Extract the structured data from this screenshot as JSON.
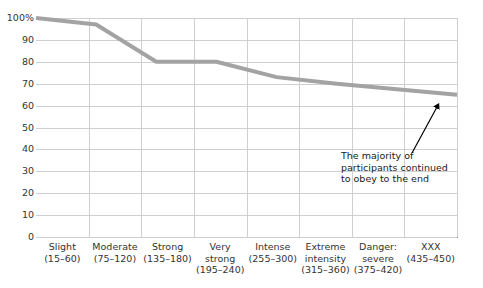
{
  "chart_data": {
    "type": "line",
    "title": "",
    "subtitle": "",
    "xlabel": "",
    "ylabel": "",
    "ylim": [
      0,
      100
    ],
    "grid": true,
    "legend": false,
    "legend_position": "none",
    "line_color": "#a3a3a3",
    "line_width": 4,
    "categories": [
      "Slight (15–60)",
      "Moderate (75–120)",
      "Strong (135–180)",
      "Very strong (195–240)",
      "Intense (255–300)",
      "Extreme intensity (315–360)",
      "Danger: severe (375–420)",
      "XXX (435–450)"
    ],
    "category_labels": [
      {
        "name": "Slight",
        "range": "(15–60)"
      },
      {
        "name": "Moderate",
        "range": "(75–120)"
      },
      {
        "name": "Strong",
        "range": "(135–180)"
      },
      {
        "name": "Very strong",
        "range": "(195–240)"
      },
      {
        "name": "Intense",
        "range": "(255–300)"
      },
      {
        "name": "Extreme intensity",
        "range": "(315–360)"
      },
      {
        "name": "Danger: severe",
        "range": "(375–420)"
      },
      {
        "name": "XXX",
        "range": "(435–450)"
      }
    ],
    "values": [
      100,
      97,
      80,
      80,
      73,
      70,
      67.5,
      65
    ],
    "ytick_labels": [
      "100%",
      "90",
      "80",
      "70",
      "60",
      "50",
      "40",
      "30",
      "20",
      "10",
      "0"
    ],
    "ytick_values": [
      100,
      90,
      80,
      70,
      60,
      50,
      40,
      30,
      20,
      10,
      0
    ],
    "annotations": [
      {
        "lines": [
          "The majority of",
          "participants continued",
          "to obey to the end"
        ],
        "points_to_category": "XXX (435–450)",
        "points_to_value": 65
      }
    ]
  }
}
